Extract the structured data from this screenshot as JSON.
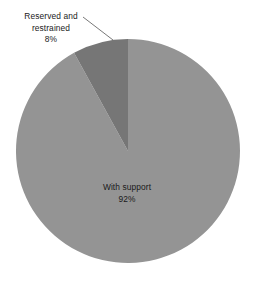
{
  "chart_data": {
    "type": "pie",
    "title": "",
    "subtitle": "",
    "xlabel": "",
    "ylabel": "",
    "categories": [
      "With support",
      "Reserved and restrained"
    ],
    "values": [
      92,
      8
    ],
    "value_unit": "%",
    "slices": [
      {
        "label": "With support",
        "value": 92,
        "value_label": "92%",
        "color": "#949494",
        "label_placement": "inside",
        "start_angle_deg": 0,
        "end_angle_deg": 331.2
      },
      {
        "label": "Reserved and restrained",
        "value": 8,
        "value_label": "8%",
        "color": "#767676",
        "label_placement": "outside-callout",
        "start_angle_deg": 331.2,
        "end_angle_deg": 360
      }
    ],
    "legend": null,
    "legend_position": "none",
    "grid": false,
    "annotations": [
      {
        "name": "callout-leader-line",
        "from_label": "Reserved and restrained",
        "points": [
          [
            83,
            17
          ],
          [
            113,
            40
          ]
        ]
      }
    ]
  },
  "callout_label": {
    "line1": "Reserved and",
    "line2": "restrained",
    "percent": "8%"
  },
  "inner_label": {
    "line1": "With support",
    "percent": "92%"
  },
  "colors": {
    "background": "#ffffff",
    "slice_major": "#949494",
    "slice_minor": "#767676",
    "text": "#1a1a1a",
    "leader_line": "#555555"
  }
}
